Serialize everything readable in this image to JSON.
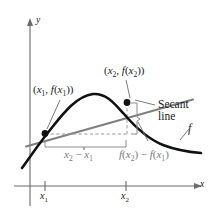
{
  "figure": {
    "background": "#ffffff",
    "width": 209,
    "height": 214
  },
  "axes": {
    "y_label": "y",
    "x_label": "x",
    "axis_color": "#6b6b6b",
    "origin": {
      "x": 30,
      "y": 186
    },
    "x_axis_end": {
      "x": 200,
      "y": 186
    },
    "y_axis_top": {
      "x": 30,
      "y": 20
    }
  },
  "ticks": [
    {
      "name": "x1",
      "label_main": "x",
      "label_sub": "1",
      "x": 45,
      "y": 186
    },
    {
      "name": "x2",
      "label_main": "x",
      "label_sub": "2",
      "x": 126,
      "y": 186
    }
  ],
  "points": [
    {
      "name": "point-x1",
      "label_text": "(x₁, f(x₁))",
      "label_main": "(x",
      "sub1": "1",
      "mid": ", f(x",
      "sub2": "1",
      "tail": "))",
      "cx": 45,
      "cy": 134,
      "color": "#111111"
    },
    {
      "name": "point-x2",
      "label_text": "(x₂, f(x₂))",
      "label_main": "(x",
      "sub1": "2",
      "mid": ", f(x",
      "sub2": "2",
      "tail": "))",
      "cx": 127,
      "cy": 102,
      "color": "#111111"
    }
  ],
  "annotations": {
    "secant_line_1": "Secant",
    "secant_line_2": "line",
    "function_label": "f",
    "run_label_main": "x",
    "run_label_sub1": "2",
    "run_label_op": " − ",
    "run_label_main2": "x",
    "run_label_sub2": "1",
    "rise_label": "f(x₂) − f(x₁)",
    "rise_main": "f(x",
    "rise_sub1": "2",
    "rise_mid": ") − f(x",
    "rise_sub2": "1",
    "rise_tail": ")"
  },
  "colors": {
    "curve": "#111111",
    "secant": "#7a7a7a",
    "dashed": "#8c8c8c",
    "brace": "#8c8c8c",
    "axis": "#6b6b6b",
    "leader": "#6b6b6b",
    "text": "#1a1a1a"
  },
  "geometry": {
    "curve_path": "M 24 165 C 34 152 40 142 52 128 C 64 114 76 98 92 95 C 104 93 112 101 122 112 C 134 126 146 138 162 144 C 176 149 188 151 200 152",
    "secant_path": "M 26 146 L 192 100",
    "dash_horizontal": "M 45 134 L 127 134",
    "dash_vertical": "M 127 134 L 127 103",
    "brace_run": "run-bracket",
    "brace_rise": "rise-bracket"
  }
}
